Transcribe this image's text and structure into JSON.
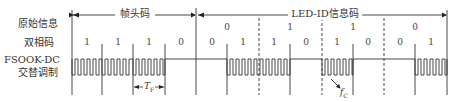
{
  "row_labels": {
    "original": "原始信息",
    "biphase": "双相码",
    "modulation_line1": "FSOOK-DC",
    "modulation_line2": "交替调制"
  },
  "segments": {
    "frame_header": "帧头码",
    "led_id": "LED-ID信息码"
  },
  "original_bits": [
    "0",
    "1",
    "1",
    "0"
  ],
  "biphase_bits": {
    "header": [
      "1",
      "1",
      "1",
      "0"
    ],
    "led_id": [
      "0",
      "1",
      "1",
      "0",
      "1",
      "0",
      "0",
      "1"
    ]
  },
  "annotations": {
    "period_symbol": "T",
    "period_subscript": "F",
    "carrier_symbol": "f",
    "carrier_subscript": "C"
  },
  "colors": {
    "line": "#333333",
    "background": "#ffffff"
  }
}
